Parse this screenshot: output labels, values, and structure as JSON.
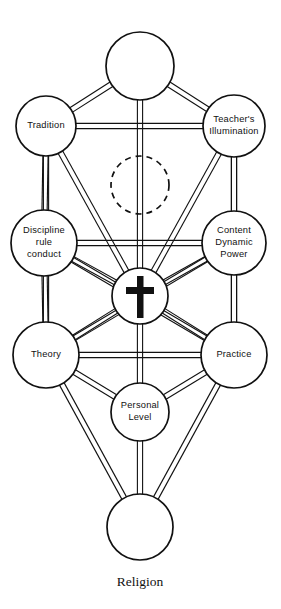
{
  "diagram": {
    "title": "Religion",
    "caption": "Religion",
    "type": "tree-of-life",
    "colors": {
      "background": "#ffffff",
      "stroke": "#111111",
      "node_fill": "#ffffff",
      "symbol": "#111111"
    },
    "nodes": [
      {
        "id": "crown",
        "label": "",
        "lines": [],
        "cx": 140,
        "cy": 66,
        "r": 34,
        "style": "solid",
        "symbol": "none"
      },
      {
        "id": "tradition",
        "label": "Tradition",
        "lines": [
          "Tradition"
        ],
        "cx": 46,
        "cy": 126,
        "r": 30,
        "style": "solid",
        "symbol": "none"
      },
      {
        "id": "teacher",
        "label": "Teacher's Illumination",
        "lines": [
          "Teacher's",
          "Illumination"
        ],
        "cx": 234,
        "cy": 126,
        "r": 31,
        "style": "solid",
        "symbol": "none"
      },
      {
        "id": "hidden",
        "label": "",
        "lines": [],
        "cx": 140,
        "cy": 185,
        "r": 29,
        "style": "dashed",
        "symbol": "none"
      },
      {
        "id": "discipline",
        "label": "Discipline rule conduct",
        "lines": [
          "Discipline",
          "rule",
          "conduct"
        ],
        "cx": 44,
        "cy": 243,
        "r": 33,
        "style": "solid",
        "symbol": "none"
      },
      {
        "id": "content",
        "label": "Content Dynamic Power",
        "lines": [
          "Content",
          "Dynamic",
          "Power"
        ],
        "cx": 234,
        "cy": 243,
        "r": 32,
        "style": "solid",
        "symbol": "none"
      },
      {
        "id": "center",
        "label": "",
        "lines": [],
        "cx": 140,
        "cy": 296,
        "r": 28,
        "style": "solid",
        "symbol": "cross"
      },
      {
        "id": "theory",
        "label": "Theory",
        "lines": [
          "Theory"
        ],
        "cx": 46,
        "cy": 355,
        "r": 33,
        "style": "solid",
        "symbol": "none"
      },
      {
        "id": "practice",
        "label": "Practice",
        "lines": [
          "Practice"
        ],
        "cx": 234,
        "cy": 355,
        "r": 33,
        "style": "solid",
        "symbol": "none"
      },
      {
        "id": "personal",
        "label": "Personal Level",
        "lines": [
          "Personal",
          "Level"
        ],
        "cx": 140,
        "cy": 412,
        "r": 29,
        "style": "solid",
        "symbol": "none"
      },
      {
        "id": "base",
        "label": "",
        "lines": [],
        "cx": 140,
        "cy": 527,
        "r": 33,
        "style": "solid",
        "symbol": "none"
      }
    ],
    "edges": [
      {
        "from": "crown",
        "to": "tradition"
      },
      {
        "from": "crown",
        "to": "teacher"
      },
      {
        "from": "crown",
        "to": "center"
      },
      {
        "from": "tradition",
        "to": "teacher"
      },
      {
        "from": "tradition",
        "to": "discipline"
      },
      {
        "from": "tradition",
        "to": "center"
      },
      {
        "from": "tradition",
        "to": "theory"
      },
      {
        "from": "teacher",
        "to": "content"
      },
      {
        "from": "teacher",
        "to": "center"
      },
      {
        "from": "teacher",
        "to": "practice"
      },
      {
        "from": "discipline",
        "to": "content"
      },
      {
        "from": "discipline",
        "to": "center"
      },
      {
        "from": "discipline",
        "to": "theory"
      },
      {
        "from": "discipline",
        "to": "practice"
      },
      {
        "from": "content",
        "to": "center"
      },
      {
        "from": "content",
        "to": "practice"
      },
      {
        "from": "content",
        "to": "theory"
      },
      {
        "from": "center",
        "to": "theory"
      },
      {
        "from": "center",
        "to": "practice"
      },
      {
        "from": "center",
        "to": "personal"
      },
      {
        "from": "theory",
        "to": "practice"
      },
      {
        "from": "theory",
        "to": "personal"
      },
      {
        "from": "theory",
        "to": "base"
      },
      {
        "from": "practice",
        "to": "personal"
      },
      {
        "from": "practice",
        "to": "base"
      },
      {
        "from": "personal",
        "to": "base"
      }
    ],
    "symbols": {
      "cross": {
        "name": "latin-cross",
        "vertical": {
          "x": 137,
          "y": 276,
          "w": 6.5,
          "h": 42
        },
        "horizontal": {
          "x": 126,
          "y": 287,
          "w": 28,
          "h": 7
        }
      }
    }
  }
}
